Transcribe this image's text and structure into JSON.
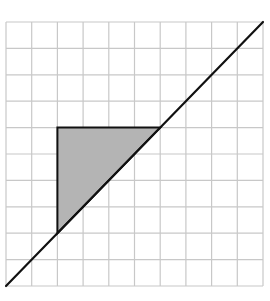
{
  "diagram": {
    "type": "grid-with-line-and-triangle",
    "grid": {
      "columns": 10,
      "rows": 10,
      "left": 6,
      "top": 22,
      "width": 257,
      "height": 264,
      "line_color": "#c8c8c8"
    },
    "diagonal_line": {
      "from_cell": [
        0,
        10
      ],
      "to_cell": [
        10,
        0
      ],
      "color": "#111111",
      "width": 2.2
    },
    "shaded_triangle": {
      "vertices_cell": [
        [
          2,
          4
        ],
        [
          6,
          4
        ],
        [
          2,
          8
        ]
      ],
      "fill": "#b4b4b4",
      "stroke": "#111111",
      "stroke_width": 2
    }
  }
}
